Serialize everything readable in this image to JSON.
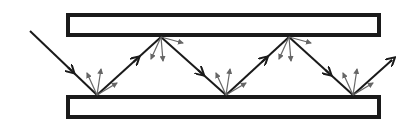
{
  "diagram": {
    "title": "",
    "colors": {
      "background": "#ffffff",
      "plate_stroke": "#1a1a1a",
      "ray": "#1a1a1a",
      "scatter": "#666666"
    },
    "plates": [
      {
        "name": "top-plate",
        "x": 68,
        "y": 15,
        "w": 311,
        "h": 20
      },
      {
        "name": "bottom-plate",
        "x": 68,
        "y": 97,
        "w": 311,
        "h": 20
      }
    ],
    "ray_points": [
      [
        30,
        31
      ],
      [
        97,
        95
      ],
      [
        161,
        37
      ],
      [
        226,
        95
      ],
      [
        289,
        37
      ],
      [
        353,
        95
      ],
      [
        392,
        60
      ]
    ],
    "reflections": [
      {
        "x": 97,
        "y": 95,
        "side": "bottom"
      },
      {
        "x": 161,
        "y": 37,
        "side": "top"
      },
      {
        "x": 226,
        "y": 95,
        "side": "bottom"
      },
      {
        "x": 289,
        "y": 37,
        "side": "top"
      },
      {
        "x": 353,
        "y": 95,
        "side": "bottom"
      }
    ]
  }
}
